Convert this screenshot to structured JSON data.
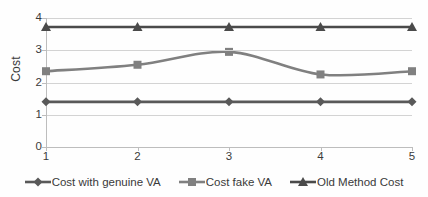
{
  "chart_data": {
    "type": "line",
    "title": "",
    "xlabel": "",
    "ylabel": "Cost",
    "x": [
      1,
      2,
      3,
      4,
      5
    ],
    "categories": [
      "1",
      "2",
      "3",
      "4",
      "5"
    ],
    "ylim": [
      0,
      4
    ],
    "yticks": [
      0,
      1,
      2,
      3,
      4
    ],
    "ytick_labels": [
      "0",
      "1",
      "2",
      "3",
      "4"
    ],
    "grid": true,
    "legend_position": "bottom",
    "smoothed": true,
    "series": [
      {
        "name": "Cost with genuine VA",
        "marker": "diamond",
        "color": "#595959",
        "values": [
          1.4,
          1.4,
          1.4,
          1.4,
          1.4
        ]
      },
      {
        "name": "Cost fake VA",
        "marker": "square",
        "color": "#808080",
        "values": [
          2.35,
          2.55,
          2.95,
          2.25,
          2.35
        ]
      },
      {
        "name": "Old Method Cost",
        "marker": "triangle",
        "color": "#4a4a4a",
        "values": [
          3.72,
          3.72,
          3.72,
          3.72,
          3.72
        ]
      }
    ]
  },
  "axes": {
    "y_title": "Cost",
    "y_labels": [
      "4",
      "3",
      "2",
      "1",
      "0"
    ],
    "x_labels": [
      "1",
      "2",
      "3",
      "4",
      "5"
    ]
  },
  "legend": {
    "items": [
      {
        "label": "Cost with genuine VA",
        "marker": "diamond-marker-icon"
      },
      {
        "label": "Cost fake VA",
        "marker": "square-marker-icon"
      },
      {
        "label": "Old Method Cost",
        "marker": "triangle-marker-icon"
      }
    ]
  },
  "colors": {
    "grid": "#d3d3d3",
    "axis": "#bdbdbd",
    "text": "#3a3a3a",
    "series_genuine": "#595959",
    "series_fake": "#808080",
    "series_old": "#4a4a4a"
  }
}
